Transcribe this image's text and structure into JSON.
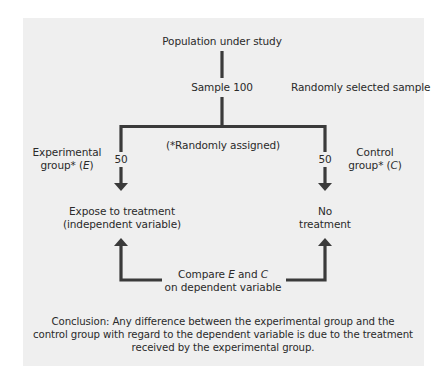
{
  "diagram": {
    "title_node": "Population under study",
    "sample_node": "Sample 100",
    "sample_note": "Randomly selected sample",
    "assignment_note": "(*Randomly assigned)",
    "experimental": {
      "label_line1": "Experimental",
      "label_line2_prefix": "group* (",
      "label_symbol": "E",
      "label_line2_suffix": ")",
      "count": "50",
      "outcome_line1": "Expose to treatment",
      "outcome_line2": "(independent variable)"
    },
    "control": {
      "label_line1": "Control",
      "label_line2_prefix": "group* (",
      "label_symbol": "C",
      "label_line2_suffix": ")",
      "count": "50",
      "outcome_line1": "No",
      "outcome_line2": "treatment"
    },
    "compare": {
      "prefix": "Compare ",
      "symbol_e": "E",
      "middle": " and ",
      "symbol_c": "C",
      "line2": "on dependent variable"
    },
    "conclusion": {
      "line1": "Conclusion: Any difference between the experimental group and the",
      "line2": "control group with regard to the dependent variable is due to the treatment",
      "line3": "received by the experimental group."
    },
    "colors": {
      "panel": "#efefef",
      "lines": "#3a3a3a",
      "text": "#2a2a2a"
    }
  }
}
